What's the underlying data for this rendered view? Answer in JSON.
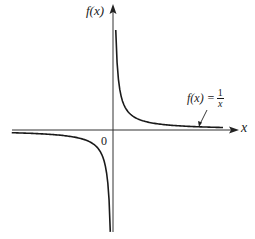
{
  "chart_data": {
    "type": "line",
    "title": "",
    "xlabel": "x",
    "ylabel": "f(x)",
    "origin_label": "0",
    "annotation": {
      "text": "f(x) = 1/x",
      "lhs": "f(x) =",
      "numerator": "1",
      "denominator": "x",
      "points_to": "right branch near positive x-axis"
    },
    "grid": false,
    "legend": null,
    "function": "f(x) = 1/x",
    "series": [
      {
        "name": "right branch (x > 0)",
        "x": [
          0.1,
          0.2,
          0.3,
          0.5,
          0.75,
          1,
          1.5,
          2,
          3,
          4
        ],
        "values": [
          10,
          5,
          3.33,
          2,
          1.33,
          1,
          0.67,
          0.5,
          0.33,
          0.25
        ]
      },
      {
        "name": "left branch (x < 0)",
        "x": [
          -4,
          -3,
          -2,
          -1.5,
          -1,
          -0.75,
          -0.5,
          -0.3,
          -0.2,
          -0.1
        ],
        "values": [
          -0.25,
          -0.33,
          -0.5,
          -0.67,
          -1,
          -1.33,
          -2,
          -3.33,
          -5,
          -10
        ]
      }
    ],
    "asymptotes": {
      "vertical": "x = 0",
      "horizontal": "y = 0"
    },
    "axes": {
      "x_arrow": true,
      "y_arrow": true,
      "ticks": false
    },
    "colors": {
      "curve": "#1a1a1a",
      "axes": "#333333",
      "background": "#ffffff"
    }
  },
  "labels": {
    "y_axis": "f(x)",
    "x_axis": "x",
    "origin": "0",
    "fn_lhs": "f(x) =",
    "fn_num": "1",
    "fn_den": "x"
  }
}
